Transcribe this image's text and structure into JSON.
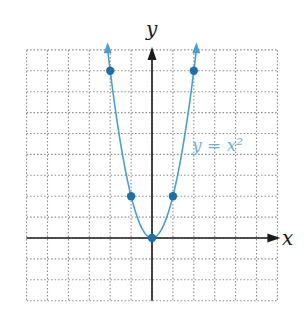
{
  "chart_data": {
    "type": "line",
    "title": "",
    "xlabel": "x",
    "ylabel": "y",
    "function_label": "y = x²",
    "series": [
      {
        "name": "y = x^2",
        "x": [
          -2,
          -1,
          0,
          1,
          2
        ],
        "y": [
          4,
          1,
          0,
          1,
          4
        ],
        "marked_points": [
          [
            -2,
            4
          ],
          [
            -1,
            1
          ],
          [
            0,
            0
          ],
          [
            1,
            1
          ],
          [
            2,
            4
          ]
        ]
      }
    ],
    "grid": true,
    "grid_style": "dotted",
    "grid_cells": {
      "left": 6,
      "right": 6,
      "above": 9,
      "below": 3
    },
    "x_units_per_cell": 1,
    "y_units_per_cell": 0.5,
    "xlim": [
      -6,
      6
    ],
    "ylim": [
      -1.5,
      4.5
    ],
    "arrows_on_curve_ends": true
  },
  "colors": {
    "curve": "#4a9fd0",
    "points": "#1f6fa3",
    "axis": "#1a1a1a",
    "grid": "#8a8a8a",
    "label": "#6fb0da"
  }
}
